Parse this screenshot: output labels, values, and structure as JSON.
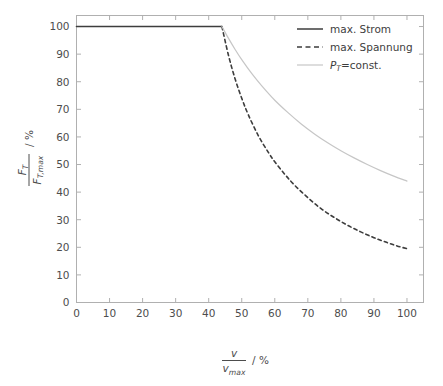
{
  "chart_data": {
    "type": "line",
    "title": "",
    "xlabel": "v / v_max  / %",
    "ylabel": "F_T / F_T,max  / %",
    "xlim": [
      0,
      105
    ],
    "ylim": [
      0,
      104
    ],
    "grid": false,
    "legend_position": "top-right",
    "x_ticks": [
      0,
      10,
      20,
      30,
      40,
      50,
      60,
      70,
      80,
      90,
      100
    ],
    "y_ticks": [
      0,
      10,
      20,
      30,
      40,
      50,
      60,
      70,
      80,
      90,
      100
    ],
    "knee_x": 44,
    "series": [
      {
        "name": "max. Strom",
        "style": "solid",
        "color": "#3d3d3d",
        "x": [
          0,
          5,
          10,
          15,
          20,
          25,
          30,
          35,
          40,
          43,
          44
        ],
        "values": [
          100,
          100,
          100,
          100,
          100,
          100,
          100,
          100,
          100,
          100,
          100
        ]
      },
      {
        "name": "max. Spannung",
        "style": "dashed",
        "color": "#3d3d3d",
        "x": [
          44,
          46,
          48,
          50,
          52,
          55,
          58,
          60,
          63,
          66,
          70,
          74,
          78,
          82,
          86,
          90,
          94,
          97,
          100
        ],
        "values": [
          100,
          89.5,
          81,
          74,
          68,
          60.5,
          54.5,
          51,
          46.5,
          42.5,
          38,
          34,
          30.8,
          28,
          25.6,
          23.5,
          21.7,
          20.5,
          19.5
        ]
      },
      {
        "name": "P_T=const.",
        "style": "solid",
        "color": "#c6c6c6",
        "x": [
          44,
          46,
          48,
          50,
          53,
          56,
          60,
          64,
          68,
          72,
          76,
          80,
          84,
          88,
          92,
          96,
          100
        ],
        "values": [
          100,
          95.7,
          91.7,
          88,
          83,
          78.6,
          73.3,
          68.8,
          64.7,
          61.1,
          57.9,
          55,
          52.4,
          50,
          47.8,
          45.8,
          44
        ]
      }
    ]
  },
  "legend": {
    "items": [
      {
        "label": "max. Strom",
        "style": "solid",
        "color": "#3d3d3d"
      },
      {
        "label": "max. Spannung",
        "style": "dashed",
        "color": "#3d3d3d"
      },
      {
        "label": "P_T=const.",
        "style": "solid",
        "color": "#c6c6c6"
      }
    ],
    "item3_symbol_P": "P",
    "item3_symbol_sub": "T",
    "item3_symbol_rest": "=const."
  },
  "axes": {
    "x_tick_labels": [
      "0",
      "10",
      "20",
      "30",
      "40",
      "50",
      "60",
      "70",
      "80",
      "90",
      "100"
    ],
    "y_tick_labels": [
      "0",
      "10",
      "20",
      "30",
      "40",
      "50",
      "60",
      "70",
      "80",
      "90",
      "100"
    ],
    "x_label_numerator": "v",
    "x_label_denominator_main": "v",
    "x_label_denominator_sub": "max",
    "x_label_unit": "/ %",
    "y_label_numerator_main": "F",
    "y_label_numerator_sub": "T",
    "y_label_denominator_main": "F",
    "y_label_denominator_sub": "T,max",
    "y_label_unit": "/ %"
  },
  "colors": {
    "background": "#ffffff",
    "frame": "#b0b0b0",
    "tick": "#b0b0b0",
    "text": "#4d4d4d",
    "series_dark": "#3d3d3d",
    "series_light": "#c6c6c6"
  }
}
